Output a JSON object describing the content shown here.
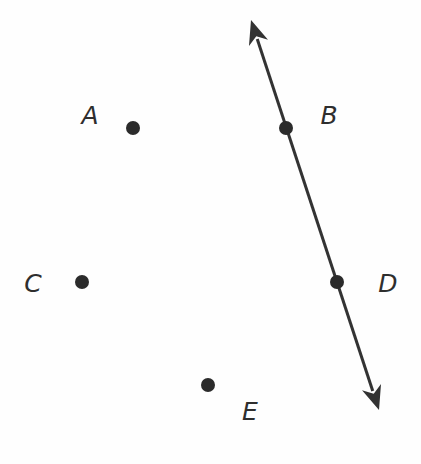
{
  "diagram": {
    "type": "geometry",
    "colors": {
      "stroke": "#333333",
      "point": "#2b2b2b",
      "label": "#2e2e2e",
      "background": "#fefefe"
    },
    "line": {
      "name": "line-BD",
      "passes_through": [
        "B",
        "D"
      ],
      "from": {
        "x": 251,
        "y": 20
      },
      "to": {
        "x": 379,
        "y": 410
      },
      "arrows": "both"
    },
    "points": [
      {
        "id": "A",
        "label": "A",
        "x": 133,
        "y": 128,
        "label_x": 90,
        "label_y": 115
      },
      {
        "id": "B",
        "label": "B",
        "x": 286,
        "y": 128,
        "label_x": 329,
        "label_y": 115
      },
      {
        "id": "C",
        "label": "C",
        "x": 82,
        "y": 282,
        "label_x": 33,
        "label_y": 283
      },
      {
        "id": "D",
        "label": "D",
        "x": 337,
        "y": 282,
        "label_x": 388,
        "label_y": 283
      },
      {
        "id": "E",
        "label": "E",
        "x": 208,
        "y": 385,
        "label_x": 250,
        "label_y": 411
      }
    ]
  }
}
